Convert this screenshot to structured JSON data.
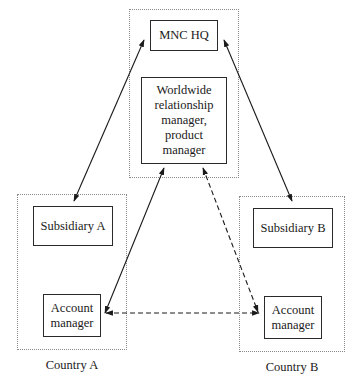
{
  "diagram": {
    "regions": {
      "hq": {
        "label": ""
      },
      "country_a": {
        "label": "Country A"
      },
      "country_b": {
        "label": "Country B"
      }
    },
    "nodes": {
      "mnc_hq": "MNC HQ",
      "worldwide_manager": "Worldwide relationship manager, product manager",
      "subsidiary_a": "Subsidiary A",
      "account_manager_a": "Account manager",
      "subsidiary_b": "Subsidiary B",
      "account_manager_b": "Account manager"
    },
    "edges": [
      {
        "from": "MNC HQ",
        "to": "Subsidiary A",
        "style": "solid",
        "direction": "both"
      },
      {
        "from": "MNC HQ",
        "to": "Subsidiary B",
        "style": "solid",
        "direction": "both"
      },
      {
        "from": "Worldwide relationship manager, product manager",
        "to": "Account manager (Country A)",
        "style": "solid",
        "direction": "both"
      },
      {
        "from": "Worldwide relationship manager, product manager",
        "to": "Account manager (Country B)",
        "style": "dashed",
        "direction": "both"
      },
      {
        "from": "Account manager (Country A)",
        "to": "Account manager (Country B)",
        "style": "dashed",
        "direction": "both"
      }
    ],
    "colors": {
      "line": "#1a1a1a",
      "region_border": "#8a8a8a"
    }
  }
}
